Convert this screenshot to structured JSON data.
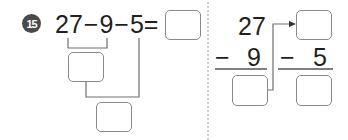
{
  "problem": {
    "number": "15",
    "expression": {
      "term1": "27",
      "op1": "−",
      "term2": "9",
      "op2": "−",
      "term3": "5",
      "equals": "="
    },
    "vertical_step1": {
      "top": "27",
      "operator": "−",
      "bottom": "9"
    },
    "vertical_step2": {
      "operator": "−",
      "bottom": "5"
    },
    "answer_boxes": {
      "final_answer": "",
      "intermediate_bracket": "",
      "final_bracket": "",
      "step1_result": "",
      "step2_top": "",
      "step2_result": ""
    }
  },
  "colors": {
    "text": "#231f20",
    "badge": "#4a4a4a",
    "box_border": "#8a8a8a",
    "line": "#6e6e6e",
    "divider": "#9a9a9a"
  }
}
